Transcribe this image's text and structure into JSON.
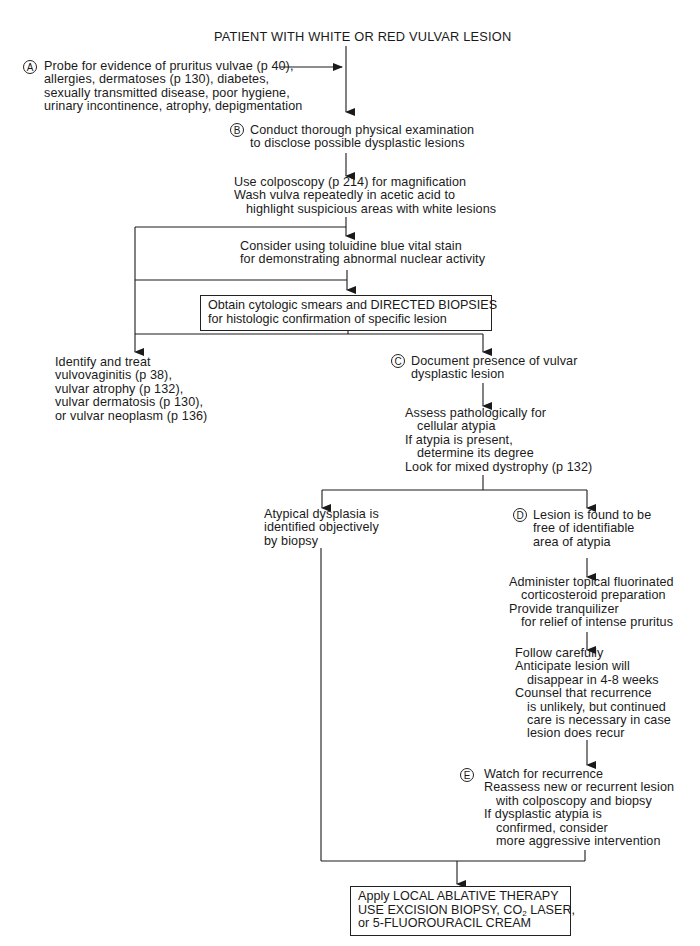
{
  "title": "PATIENT WITH WHITE OR RED VULVAR LESION",
  "nodes": {
    "A": {
      "badge": "A",
      "lines": [
        "Probe for evidence of pruritus vulvae (p 40),",
        "allergies, dermatoses (p 130), diabetes,",
        "sexually transmitted disease, poor hygiene,",
        "urinary incontinence, atrophy, depigmentation"
      ]
    },
    "B": {
      "badge": "B",
      "lines": [
        "Conduct thorough physical examination",
        "to disclose possible dysplastic lesions"
      ]
    },
    "colposcopy": {
      "lines": [
        "Use colposcopy (p 214) for magnification",
        "Wash vulva repeatedly in acetic acid to",
        "highlight suspicious areas with white lesions"
      ]
    },
    "toluidine": {
      "lines": [
        "Consider using toluidine blue vital stain",
        "for demonstrating abnormal nuclear activity"
      ]
    },
    "biopsy_box": {
      "lines": [
        "Obtain cytologic smears and DIRECTED BIOPSIES",
        "for histologic confirmation of specific lesion"
      ]
    },
    "identify": {
      "lines": [
        "Identify and treat",
        "vulvovaginitis (p 38),",
        "vulvar atrophy (p 132),",
        "vulvar dermatosis (p 130),",
        "or vulvar neoplasm (p 136)"
      ]
    },
    "C": {
      "badge": "C",
      "lines": [
        "Document presence of vulvar",
        "dysplastic lesion"
      ]
    },
    "assess": {
      "lines": [
        "Assess pathologically for",
        "cellular atypia",
        "If atypia is present,",
        "determine its degree",
        "Look for mixed dystrophy (p 132)"
      ]
    },
    "atypical": {
      "lines": [
        "Atypical dysplasia is",
        "identified objectively",
        "by biopsy"
      ]
    },
    "D": {
      "badge": "D",
      "lines": [
        "Lesion is found to be",
        "free of identifiable",
        "area of atypia"
      ]
    },
    "administer": {
      "lines": [
        "Administer topical fluorinated",
        "corticosteroid preparation",
        "Provide tranquilizer",
        "for relief of intense pruritus"
      ]
    },
    "follow": {
      "lines": [
        "Follow carefully",
        "Anticipate lesion will",
        "disappear in 4-8 weeks",
        "Counsel that recurrence",
        "is unlikely, but continued",
        "care is necessary in case",
        "lesion does recur"
      ]
    },
    "E": {
      "badge": "E",
      "lines": [
        "Watch for recurrence",
        "Reassess new or recurrent lesion",
        "with colposcopy and biopsy",
        "If dysplastic atypia is",
        "confirmed, consider",
        "more aggressive intervention"
      ]
    },
    "final_box": {
      "line1": "Apply LOCAL ABLATIVE THERAPY",
      "line2_pre": "USE EXCISION BIOPSY, CO",
      "line2_sub": "2",
      "line2_post": " LASER,",
      "line3": "or 5-FLUOROURACIL CREAM"
    }
  }
}
